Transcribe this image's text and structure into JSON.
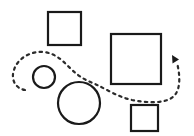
{
  "canvas": {
    "width": 194,
    "height": 136,
    "background_color": "#ffffff",
    "title": "Dashed path weaving among squares and circles"
  },
  "style": {
    "shape_stroke_color": "#1a1a1a",
    "shape_fill_color": "#ffffff",
    "shape_stroke_width": 2.2,
    "path_stroke_color": "#2b2b2b",
    "path_stroke_width": 2.2,
    "path_dash_pattern": "2.4 4.2",
    "arrow_fill_color": "#1a1a1a"
  },
  "shapes": [
    {
      "id": "square-top-left",
      "name": "square",
      "x": 48,
      "y": 12,
      "width": 33,
      "height": 33
    },
    {
      "id": "square-large-right",
      "name": "square",
      "x": 111,
      "y": 34,
      "width": 50,
      "height": 50
    },
    {
      "id": "square-bottom-right",
      "name": "square",
      "x": 131,
      "y": 105,
      "width": 27,
      "height": 26
    },
    {
      "id": "circle-small",
      "name": "circle",
      "cx": 44,
      "cy": 77,
      "r": 11
    },
    {
      "id": "circle-large",
      "name": "circle",
      "cx": 79,
      "cy": 103,
      "r": 21
    }
  ],
  "path": {
    "id": "dashed-arrow-path",
    "d": "M 25 90 C 14 88 11 78 14 70 C 17 59 30 51 43 52 C 55 53 62 60 70 68 C 78 76 85 80 95 84 C 106 89 118 97 132 100 C 148 103 166 104 174 96 C 181 89 180 74 177 63",
    "arrow_tip": {
      "x": 177,
      "y": 57
    },
    "arrow_points": "172.5,63.5 172.0,55.0 179.0,59.5",
    "direction": "clockwise-toward-upper-right"
  }
}
